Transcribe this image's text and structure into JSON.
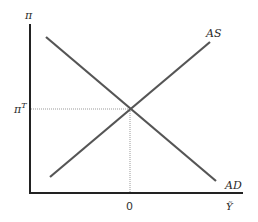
{
  "diagram": {
    "y_axis_label": "π",
    "x_axis_label": "Ỹ",
    "equilibrium_y_label": "π",
    "equilibrium_y_label_sup": "T",
    "equilibrium_x_label": "0",
    "curves": [
      {
        "name": "AS",
        "label": "AS",
        "slope": "upward"
      },
      {
        "name": "AD",
        "label": "AD",
        "slope": "downward"
      }
    ],
    "colors": {
      "axis": "#222222",
      "curve": "#555555",
      "guide": "#999999"
    }
  }
}
